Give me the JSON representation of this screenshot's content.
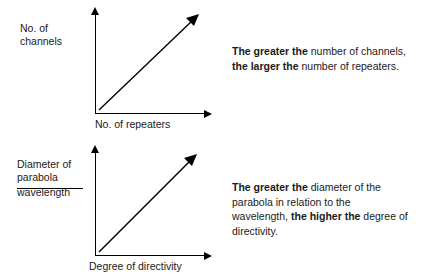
{
  "blocks": [
    {
      "id": "channels-repeaters",
      "y_axis_label_line1": "No. of",
      "y_axis_label_line2": "channels",
      "x_axis_label": "No. of repeaters",
      "caption_parts": [
        {
          "text": "The greater the",
          "bold": true
        },
        {
          "text": " number of channels, ",
          "bold": false
        },
        {
          "text": "the larger the",
          "bold": true
        },
        {
          "text": " number of repeaters.",
          "bold": false
        }
      ]
    },
    {
      "id": "parabola-directivity",
      "y_axis_label_line1": "Diameter of",
      "y_axis_label_line2": "parabola",
      "y_axis_label_line3": "wavelength",
      "x_axis_label": "Degree of directivity",
      "caption_parts": [
        {
          "text": "The greater the",
          "bold": true
        },
        {
          "text": " diameter of the parabola in relation to the wavelength, ",
          "bold": false
        },
        {
          "text": "the higher the",
          "bold": true
        },
        {
          "text": " degree of directivity.",
          "bold": false
        }
      ]
    }
  ],
  "colors": {
    "line": "#000000",
    "text": "#1a1a1a",
    "background": "#ffffff"
  }
}
